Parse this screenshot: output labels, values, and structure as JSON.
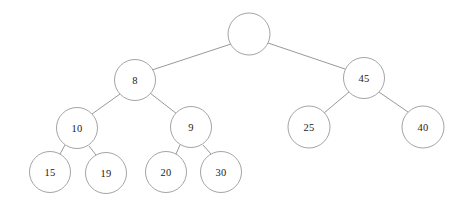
{
  "figure": {
    "name": "binary-tree-diagram",
    "type": "tree",
    "background_color": "#ffffff",
    "node_stroke_color": "#9a9a9a",
    "edge_stroke_color": "#8c8c8c",
    "label_color": "#1a1a1a"
  },
  "chart_data": {
    "type": "diagram",
    "title": "",
    "nodes": [
      {
        "id": "root",
        "label": "",
        "cx": 249,
        "cy": 34,
        "r": 21,
        "level": 0
      },
      {
        "id": "n8",
        "label": "8",
        "cx": 135,
        "cy": 80,
        "r": 20.5,
        "level": 1
      },
      {
        "id": "n45",
        "label": "45",
        "cx": 364,
        "cy": 78,
        "r": 20.5,
        "level": 1
      },
      {
        "id": "n10",
        "label": "10",
        "cx": 77,
        "cy": 128,
        "r": 20.5,
        "level": 2
      },
      {
        "id": "n9",
        "label": "9",
        "cx": 191,
        "cy": 127,
        "r": 20.5,
        "level": 2
      },
      {
        "id": "n25",
        "label": "25",
        "cx": 309,
        "cy": 127,
        "r": 21,
        "level": 2
      },
      {
        "id": "n40",
        "label": "40",
        "cx": 423,
        "cy": 127,
        "r": 21,
        "level": 2
      },
      {
        "id": "n15",
        "label": "15",
        "cx": 50,
        "cy": 172,
        "r": 20.5,
        "level": 3
      },
      {
        "id": "n19",
        "label": "19",
        "cx": 106,
        "cy": 173,
        "r": 20.5,
        "level": 3
      },
      {
        "id": "n20",
        "label": "20",
        "cx": 166,
        "cy": 172,
        "r": 20.5,
        "level": 3
      },
      {
        "id": "n30",
        "label": "30",
        "cx": 221,
        "cy": 172,
        "r": 20.5,
        "level": 3
      }
    ],
    "edges": [
      {
        "from": "root",
        "to": "n8",
        "x1": 231,
        "y1": 44,
        "x2": 152,
        "y2": 70
      },
      {
        "from": "root",
        "to": "n45",
        "x1": 268,
        "y1": 43,
        "x2": 345,
        "y2": 69
      },
      {
        "from": "n8",
        "to": "n10",
        "x1": 120,
        "y1": 94,
        "x2": 92,
        "y2": 114
      },
      {
        "from": "n8",
        "to": "n9",
        "x1": 150,
        "y1": 93,
        "x2": 177,
        "y2": 114
      },
      {
        "from": "n45",
        "to": "n25",
        "x1": 349,
        "y1": 92,
        "x2": 324,
        "y2": 113
      },
      {
        "from": "n45",
        "to": "n40",
        "x1": 379,
        "y1": 92,
        "x2": 408,
        "y2": 112
      },
      {
        "from": "n10",
        "to": "n15",
        "x1": 65,
        "y1": 145,
        "x2": 60,
        "y2": 154
      },
      {
        "from": "n10",
        "to": "n19",
        "x1": 89,
        "y1": 146,
        "x2": 96,
        "y2": 155
      },
      {
        "from": "n9",
        "to": "n20",
        "x1": 180,
        "y1": 145,
        "x2": 176,
        "y2": 154
      },
      {
        "from": "n9",
        "to": "n30",
        "x1": 203,
        "y1": 145,
        "x2": 211,
        "y2": 154
      }
    ],
    "root_is_empty": true,
    "node_count": 11,
    "labels": [
      "",
      "8",
      "45",
      "10",
      "9",
      "25",
      "40",
      "15",
      "19",
      "20",
      "30"
    ]
  }
}
